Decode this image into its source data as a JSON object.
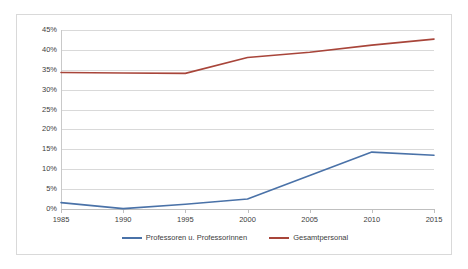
{
  "chart_data": {
    "type": "line",
    "title": "",
    "xlabel": "",
    "ylabel": "",
    "x": [
      1985,
      1990,
      1995,
      2000,
      2005,
      2010,
      2015
    ],
    "xtick_labels": [
      "1985",
      "1990",
      "1995",
      "2000",
      "2005",
      "2010",
      "2015"
    ],
    "ytick_labels": [
      "45%",
      "40%",
      "35%",
      "30%",
      "25%",
      "20%",
      "15%",
      "10%",
      "5%",
      "0%"
    ],
    "ytick_values": [
      45,
      40,
      35,
      30,
      25,
      20,
      15,
      10,
      5,
      0
    ],
    "ylim": [
      0,
      45
    ],
    "xlim": [
      1985,
      2015
    ],
    "grid": true,
    "legend_position": "bottom",
    "series": [
      {
        "name": "Professoren u. Professorinnen",
        "color": "#4A72A8",
        "values": [
          1.6,
          0.1,
          1.2,
          2.5,
          8.4,
          14.3,
          13.5
        ]
      },
      {
        "name": "Gesamtpersonal",
        "color": "#A8453A",
        "values": [
          34.3,
          34.2,
          34.1,
          38.1,
          39.4,
          41.2,
          42.7
        ]
      }
    ]
  },
  "legend": {
    "items": [
      {
        "label": "Professoren u. Professorinnen",
        "color": "#4A72A8"
      },
      {
        "label": "Gesamtpersonal",
        "color": "#A8453A"
      }
    ]
  }
}
